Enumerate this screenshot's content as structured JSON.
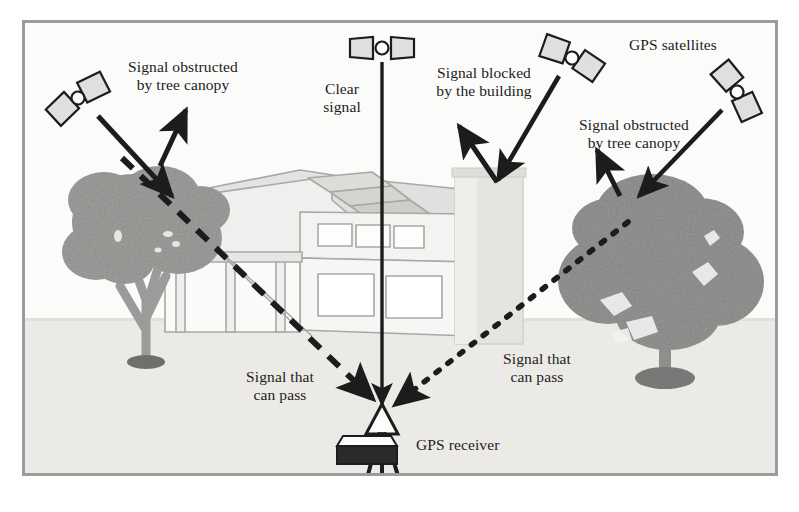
{
  "figure": {
    "frame_border_color": "#9c9c9c",
    "background_color": "#fbfbfa",
    "ground_color": "#eceae7",
    "ink_color": "#1c1c1c",
    "tree_color": "#9b9b99",
    "house_color": "#e8e8e6",
    "house_line_color": "#a8a8a6"
  },
  "labels": {
    "obstructed_left": "Signal obstructed\nby tree canopy",
    "clear_signal": "Clear\nsignal",
    "blocked_building": "Signal blocked\nby the building",
    "gps_satellites": "GPS satellites",
    "obstructed_right": "Signal obstructed\nby tree canopy",
    "can_pass_left": "Signal that\ncan pass",
    "can_pass_right": "Signal that\ncan pass",
    "gps_receiver": "GPS receiver"
  },
  "satellites": [
    {
      "id": "satellite-upper-left",
      "x": 78,
      "y": 98,
      "rotation": -35,
      "name": "GPS satellite"
    },
    {
      "id": "satellite-top-center",
      "x": 382,
      "y": 48,
      "rotation": 0,
      "name": "GPS satellite"
    },
    {
      "id": "satellite-top-right",
      "x": 572,
      "y": 58,
      "rotation": 27,
      "name": "GPS satellite"
    },
    {
      "id": "satellite-far-right",
      "x": 737,
      "y": 92,
      "rotation": 58,
      "name": "GPS satellite"
    }
  ],
  "signal_paths": [
    {
      "id": "path-tree-left-blocked",
      "style": "solid",
      "label": "obstructed_left",
      "description": "satellite to left tree canopy"
    },
    {
      "id": "path-reflect-left",
      "style": "solid",
      "label": "obstructed_left",
      "description": "arrow deflected off left tree canopy"
    },
    {
      "id": "path-clear-signal",
      "style": "solid",
      "label": "clear_signal",
      "description": "clear vertical signal to receiver"
    },
    {
      "id": "path-building-blocked",
      "style": "solid",
      "label": "blocked_building",
      "description": "satellite to building tower"
    },
    {
      "id": "path-reflect-building",
      "style": "solid",
      "label": "blocked_building",
      "description": "arrow deflected off building"
    },
    {
      "id": "path-tree-right-blocked",
      "style": "solid",
      "label": "obstructed_right",
      "description": "satellite to right tree canopy"
    },
    {
      "id": "path-reflect-right",
      "style": "solid",
      "label": "obstructed_right",
      "description": "arrow deflected off right tree canopy"
    },
    {
      "id": "path-pass-left",
      "style": "dashed",
      "label": "can_pass_left",
      "description": "dashed signal passing through left tree to receiver"
    },
    {
      "id": "path-pass-right",
      "style": "dotted",
      "label": "can_pass_right",
      "description": "dotted signal passing through right tree to receiver"
    }
  ],
  "objects": [
    {
      "id": "house",
      "name": "house"
    },
    {
      "id": "building-tower",
      "name": "building chimney tower"
    },
    {
      "id": "tree-left",
      "name": "tree"
    },
    {
      "id": "tree-right",
      "name": "tree"
    },
    {
      "id": "receiver-tripod",
      "name": "GPS receiver on tripod"
    },
    {
      "id": "receiver-case",
      "name": "equipment case"
    }
  ]
}
